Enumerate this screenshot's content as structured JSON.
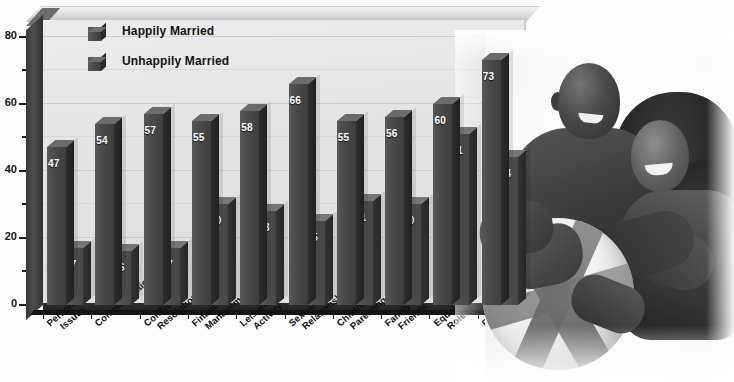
{
  "chart_data": {
    "type": "bar",
    "title": "",
    "xlabel": "",
    "ylabel": "",
    "ylim": [
      0,
      85
    ],
    "yticks": [
      0,
      20,
      40,
      60,
      80
    ],
    "yticks_minor": [
      10,
      30,
      50,
      70
    ],
    "ytick_labels": [
      "0",
      "20",
      "40",
      "60",
      "80"
    ],
    "grid": true,
    "legend_position": "top-left",
    "categories": [
      "Personal Issues",
      "Communication",
      "Conflict Resolution",
      "Financial Management",
      "Leisure Activity",
      "Sexual Relationship",
      "Children Parenting",
      "Family & Friends",
      "Equality Roles",
      "Religious Orientation"
    ],
    "category_lines": [
      [
        "Personal",
        "Issues"
      ],
      [
        "Communication",
        ""
      ],
      [
        "Conflict",
        "Resolution"
      ],
      [
        "Financial",
        "Management"
      ],
      [
        "Leisure",
        "Activity"
      ],
      [
        "Sexual",
        "Relationship"
      ],
      [
        "Children",
        "Parenting"
      ],
      [
        "Family &",
        "Friends"
      ],
      [
        "Equality",
        "Roles"
      ],
      [
        "Religious",
        "Orientation"
      ]
    ],
    "series": [
      {
        "name": "Happily Married",
        "color": "#4b4b4b",
        "values": [
          47,
          54,
          57,
          55,
          58,
          66,
          55,
          56,
          60,
          73
        ]
      },
      {
        "name": "Unhappily Married",
        "color": "#535353",
        "values": [
          17,
          16,
          17,
          30,
          28,
          25,
          31,
          30,
          51,
          44
        ]
      }
    ]
  },
  "legend": {
    "items": [
      {
        "label": "Happily Married"
      },
      {
        "label": "Unhappily Married"
      }
    ]
  },
  "photo": {
    "alt": "Smiling couple holding a beach ball"
  }
}
